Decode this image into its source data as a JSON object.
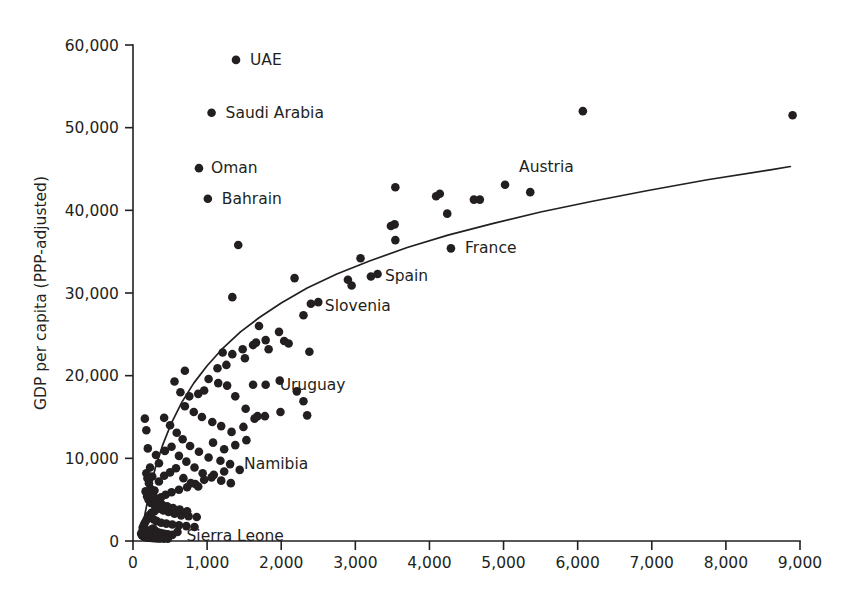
{
  "chart_data": {
    "type": "scatter",
    "title": "",
    "subtitle": "",
    "xlabel": "",
    "ylabel": "GDP per capita (PPP-adjusted)",
    "xlim": [
      0,
      9000
    ],
    "ylim": [
      0,
      60000
    ],
    "grid": false,
    "legend": null,
    "xticks": [
      0,
      1000,
      2000,
      3000,
      4000,
      5000,
      6000,
      7000,
      8000,
      9000
    ],
    "xticklabels": [
      "0",
      "1,000",
      "2,000",
      "3,000",
      "4,000",
      "5,000",
      "6,000",
      "7,000",
      "8,000",
      "9,000"
    ],
    "yticks": [
      0,
      10000,
      20000,
      30000,
      40000,
      50000,
      60000
    ],
    "yticklabels": [
      "0",
      "10,000",
      "20,000",
      "30,000",
      "40,000",
      "50,000",
      "60,000"
    ],
    "annotations": [
      {
        "text": "UAE",
        "x": 1390,
        "y": 58200,
        "dx": 14,
        "dy": 5
      },
      {
        "text": "Saudi Arabia",
        "x": 1060,
        "y": 51800,
        "dx": 14,
        "dy": 5
      },
      {
        "text": "Oman",
        "x": 890,
        "y": 45100,
        "dx": 12,
        "dy": 5
      },
      {
        "text": "Bahrain",
        "x": 1010,
        "y": 41400,
        "dx": 14,
        "dy": 5
      },
      {
        "text": "Austria",
        "x": 5020,
        "y": 43100,
        "dx": 14,
        "dy": -13
      },
      {
        "text": "France",
        "x": 4290,
        "y": 35400,
        "dx": 14,
        "dy": 5
      },
      {
        "text": "Spain",
        "x": 3210,
        "y": 32000,
        "dx": 14,
        "dy": 5
      },
      {
        "text": "Slovenia",
        "x": 2400,
        "y": 28700,
        "dx": 14,
        "dy": 7
      },
      {
        "text": "Uruguay",
        "x": 1790,
        "y": 18900,
        "dx": 14,
        "dy": 5
      },
      {
        "text": "Namibia",
        "x": 1310,
        "y": 9300,
        "dx": 14,
        "dy": 5
      },
      {
        "text": "Sierra Leone",
        "x": 560,
        "y": 1100,
        "dx": 12,
        "dy": 9
      }
    ],
    "fit_curve": {
      "description": "logarithmic best-fit trend line",
      "points": [
        [
          110,
          900
        ],
        [
          160,
          3200
        ],
        [
          220,
          5900
        ],
        [
          300,
          8800
        ],
        [
          400,
          11600
        ],
        [
          520,
          14300
        ],
        [
          660,
          16800
        ],
        [
          820,
          19100
        ],
        [
          1000,
          21200
        ],
        [
          1200,
          23200
        ],
        [
          1450,
          25300
        ],
        [
          1700,
          27000
        ],
        [
          2000,
          28800
        ],
        [
          2350,
          30600
        ],
        [
          2750,
          32300
        ],
        [
          3200,
          33900
        ],
        [
          3700,
          35500
        ],
        [
          4250,
          37000
        ],
        [
          4850,
          38400
        ],
        [
          5500,
          39800
        ],
        [
          6200,
          41100
        ],
        [
          6950,
          42400
        ],
        [
          7750,
          43700
        ],
        [
          8600,
          44900
        ],
        [
          8870,
          45300
        ]
      ]
    },
    "points": [
      [
        1390,
        58200
      ],
      [
        1060,
        51800
      ],
      [
        890,
        45100
      ],
      [
        1010,
        41400
      ],
      [
        1420,
        35800
      ],
      [
        1340,
        29500
      ],
      [
        6070,
        52000
      ],
      [
        8900,
        51500
      ],
      [
        3540,
        42800
      ],
      [
        4090,
        41700
      ],
      [
        4140,
        42000
      ],
      [
        4600,
        41300
      ],
      [
        4680,
        41300
      ],
      [
        5020,
        43100
      ],
      [
        5360,
        42200
      ],
      [
        4240,
        39600
      ],
      [
        3480,
        38100
      ],
      [
        3530,
        38300
      ],
      [
        3070,
        34200
      ],
      [
        3540,
        36400
      ],
      [
        4290,
        35400
      ],
      [
        3210,
        32000
      ],
      [
        3300,
        32300
      ],
      [
        2900,
        31600
      ],
      [
        2950,
        30900
      ],
      [
        2400,
        28700
      ],
      [
        2500,
        28900
      ],
      [
        2300,
        27300
      ],
      [
        2180,
        31800
      ],
      [
        2040,
        24200
      ],
      [
        2100,
        23900
      ],
      [
        2380,
        22900
      ],
      [
        1970,
        25300
      ],
      [
        1790,
        24300
      ],
      [
        1830,
        23200
      ],
      [
        1620,
        23700
      ],
      [
        1660,
        24000
      ],
      [
        1480,
        23200
      ],
      [
        1700,
        26000
      ],
      [
        1510,
        22100
      ],
      [
        1340,
        22600
      ],
      [
        1210,
        22800
      ],
      [
        1260,
        21300
      ],
      [
        1140,
        20900
      ],
      [
        1620,
        18900
      ],
      [
        1790,
        18900
      ],
      [
        1980,
        19400
      ],
      [
        2210,
        18100
      ],
      [
        2300,
        16900
      ],
      [
        2350,
        15200
      ],
      [
        1990,
        15600
      ],
      [
        1780,
        15100
      ],
      [
        1640,
        14800
      ],
      [
        1520,
        16000
      ],
      [
        1380,
        17500
      ],
      [
        1270,
        18800
      ],
      [
        1150,
        19100
      ],
      [
        1020,
        19600
      ],
      [
        960,
        18200
      ],
      [
        880,
        17800
      ],
      [
        760,
        17500
      ],
      [
        1680,
        15100
      ],
      [
        1490,
        13800
      ],
      [
        1330,
        13200
      ],
      [
        1190,
        13900
      ],
      [
        1070,
        14400
      ],
      [
        930,
        15000
      ],
      [
        820,
        15600
      ],
      [
        700,
        16300
      ],
      [
        640,
        18000
      ],
      [
        560,
        19300
      ],
      [
        700,
        20600
      ],
      [
        1080,
        11900
      ],
      [
        1230,
        11100
      ],
      [
        1380,
        11600
      ],
      [
        1530,
        12200
      ],
      [
        1310,
        9300
      ],
      [
        1180,
        9700
      ],
      [
        1020,
        10100
      ],
      [
        890,
        10800
      ],
      [
        770,
        11500
      ],
      [
        670,
        12300
      ],
      [
        590,
        13100
      ],
      [
        500,
        14000
      ],
      [
        420,
        14900
      ],
      [
        350,
        9400
      ],
      [
        310,
        10400
      ],
      [
        430,
        10900
      ],
      [
        520,
        11400
      ],
      [
        620,
        10300
      ],
      [
        720,
        9600
      ],
      [
        830,
        8900
      ],
      [
        940,
        8200
      ],
      [
        1060,
        7700
      ],
      [
        1190,
        7300
      ],
      [
        1320,
        7000
      ],
      [
        1440,
        8600
      ],
      [
        1230,
        8400
      ],
      [
        1090,
        8000
      ],
      [
        960,
        7400
      ],
      [
        840,
        6900
      ],
      [
        730,
        6500
      ],
      [
        620,
        6200
      ],
      [
        520,
        5900
      ],
      [
        440,
        5600
      ],
      [
        380,
        5300
      ],
      [
        330,
        5100
      ],
      [
        290,
        6100
      ],
      [
        350,
        7200
      ],
      [
        420,
        7900
      ],
      [
        500,
        8300
      ],
      [
        580,
        8800
      ],
      [
        680,
        7600
      ],
      [
        780,
        7000
      ],
      [
        880,
        6600
      ],
      [
        260,
        7800
      ],
      [
        230,
        8900
      ],
      [
        200,
        11200
      ],
      [
        180,
        13400
      ],
      [
        160,
        14800
      ],
      [
        300,
        4200
      ],
      [
        350,
        3900
      ],
      [
        410,
        3700
      ],
      [
        480,
        3500
      ],
      [
        560,
        3300
      ],
      [
        650,
        3100
      ],
      [
        750,
        3000
      ],
      [
        860,
        2900
      ],
      [
        240,
        4600
      ],
      [
        210,
        5000
      ],
      [
        190,
        5400
      ],
      [
        170,
        6000
      ],
      [
        280,
        2600
      ],
      [
        320,
        2400
      ],
      [
        380,
        2200
      ],
      [
        450,
        2100
      ],
      [
        530,
        2000
      ],
      [
        620,
        1900
      ],
      [
        720,
        1800
      ],
      [
        830,
        1700
      ],
      [
        160,
        2200
      ],
      [
        180,
        2500
      ],
      [
        200,
        2800
      ],
      [
        220,
        3100
      ],
      [
        250,
        3400
      ],
      [
        290,
        3600
      ],
      [
        130,
        1600
      ],
      [
        145,
        1900
      ],
      [
        160,
        1400
      ],
      [
        175,
        1200
      ],
      [
        195,
        1000
      ],
      [
        215,
        1150
      ],
      [
        240,
        1350
      ],
      [
        270,
        1500
      ],
      [
        300,
        1250
      ],
      [
        335,
        1050
      ],
      [
        375,
        950
      ],
      [
        420,
        880
      ],
      [
        470,
        800
      ],
      [
        530,
        740
      ],
      [
        600,
        1100
      ],
      [
        120,
        700
      ],
      [
        135,
        600
      ],
      [
        150,
        520
      ],
      [
        170,
        460
      ],
      [
        190,
        420
      ],
      [
        215,
        390
      ],
      [
        245,
        360
      ],
      [
        280,
        340
      ],
      [
        320,
        320
      ],
      [
        365,
        300
      ],
      [
        415,
        280
      ],
      [
        470,
        270
      ],
      [
        110,
        900
      ],
      [
        125,
        1100
      ],
      [
        140,
        1300
      ],
      [
        155,
        820
      ],
      [
        175,
        680
      ],
      [
        200,
        560
      ],
      [
        230,
        480
      ],
      [
        265,
        430
      ],
      [
        305,
        390
      ],
      [
        350,
        350
      ],
      [
        400,
        620
      ],
      [
        455,
        560
      ],
      [
        310,
        4800
      ],
      [
        270,
        5500
      ],
      [
        240,
        6300
      ],
      [
        215,
        7000
      ],
      [
        195,
        7600
      ],
      [
        180,
        8200
      ],
      [
        390,
        4400
      ],
      [
        460,
        4200
      ],
      [
        540,
        4000
      ],
      [
        630,
        3800
      ],
      [
        730,
        3600
      ]
    ]
  }
}
